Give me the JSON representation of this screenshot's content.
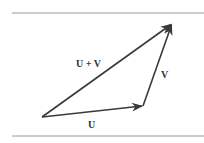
{
  "diagram": {
    "type": "vector-addition-triangle",
    "rules": {
      "color": "#9a9a9a",
      "top": {
        "x1": 12,
        "x2": 204,
        "y": 13
      },
      "bottom": {
        "x1": 12,
        "x2": 204,
        "y": 136
      }
    },
    "stroke_color": "#3a3a3a",
    "points": {
      "origin": {
        "x": 42,
        "y": 117
      },
      "u_end": {
        "x": 143,
        "y": 106
      },
      "sum_end": {
        "x": 172,
        "y": 24
      }
    },
    "vectors": [
      {
        "id": "U",
        "label": "U",
        "from": "origin",
        "to": "u_end"
      },
      {
        "id": "V",
        "label": "V",
        "from": "u_end",
        "to": "sum_end"
      },
      {
        "id": "U+V",
        "label": "U + V",
        "from": "origin",
        "to": "sum_end"
      }
    ],
    "labels": {
      "u": "U",
      "v": "V",
      "sum": "U + V"
    }
  }
}
